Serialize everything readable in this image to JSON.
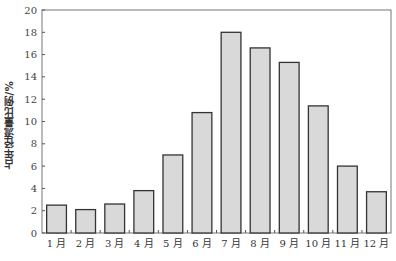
{
  "chart_data": {
    "type": "bar",
    "title": "",
    "xlabel": "",
    "ylabel": "占年径流量比例/%",
    "categories": [
      "1月",
      "2月",
      "3月",
      "4月",
      "5月",
      "6月",
      "7月",
      "8月",
      "9月",
      "10月",
      "11月",
      "12月"
    ],
    "values": [
      2.5,
      2.1,
      2.6,
      3.8,
      7.0,
      10.8,
      18.0,
      16.6,
      15.3,
      11.4,
      6.0,
      3.7
    ],
    "ylim": [
      0,
      20
    ],
    "yticks": [
      0,
      2,
      4,
      6,
      8,
      10,
      12,
      14,
      16,
      18,
      20
    ],
    "grid": false,
    "legend": null,
    "bar_fill": "#d9d9d9",
    "bar_stroke": "#333333"
  }
}
